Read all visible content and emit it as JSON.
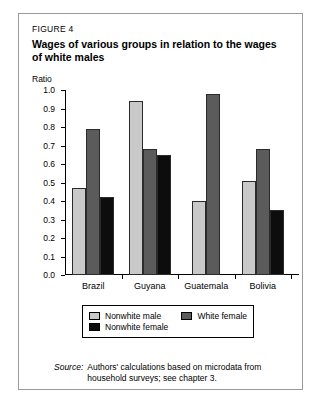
{
  "figure": {
    "label": "FIGURE 4",
    "title": "Wages of various groups in relation to the wages of white males",
    "axis_label": "Ratio",
    "source_word": "Source:",
    "source_text": "Authors' calculations based on microdata from household surveys; see chapter 3."
  },
  "chart_data": {
    "type": "bar",
    "title": "Wages of various groups in relation to the wages of white males",
    "xlabel": "",
    "ylabel": "Ratio",
    "ylim": [
      0.0,
      1.0
    ],
    "yticks": [
      "0.0",
      "0.1",
      "0.2",
      "0.3",
      "0.4",
      "0.5",
      "0.6",
      "0.7",
      "0.8",
      "0.9",
      "1.0"
    ],
    "grid": false,
    "legend_position": "bottom",
    "categories": [
      "Brazil",
      "Guyana",
      "Guatemala",
      "Bolivia"
    ],
    "series": [
      {
        "name": "Nonwhite male",
        "color": "#c9c9c9",
        "values": [
          0.47,
          0.94,
          0.4,
          0.51
        ]
      },
      {
        "name": "White female",
        "color": "#5b5b5b",
        "values": [
          0.79,
          0.68,
          0.98,
          0.68
        ]
      },
      {
        "name": "Nonwhite female",
        "color": "#0d0d0d",
        "values": [
          0.42,
          0.65,
          null,
          0.35
        ]
      }
    ]
  }
}
